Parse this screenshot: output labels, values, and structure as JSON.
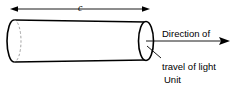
{
  "figure": {
    "background_color": "#ffffff",
    "line_color": "#000000",
    "dimension": {
      "label": "c",
      "description": "cylinder-length-dimension"
    },
    "annotations": {
      "direction": {
        "line1": "Direction of",
        "line2": "travel of light"
      },
      "cross_section": {
        "line1": "Unit",
        "line2": "cross-sectional",
        "line3": "area"
      }
    }
  }
}
